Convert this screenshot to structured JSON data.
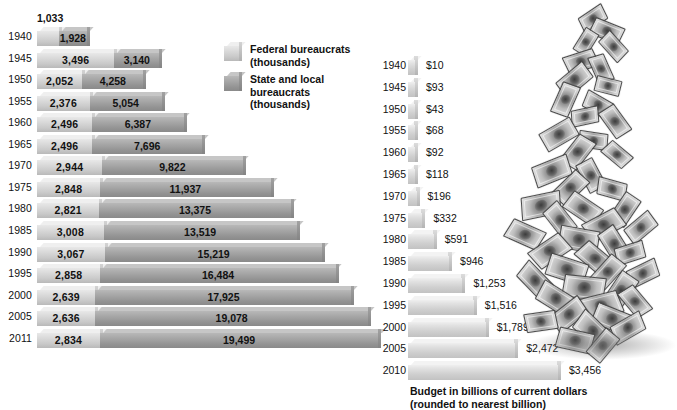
{
  "chart_data": [
    {
      "type": "bar",
      "id": "bureaucrats",
      "title": "",
      "orientation": "horizontal",
      "stacked": true,
      "xlabel": "",
      "ylabel": "",
      "categories": [
        "1940",
        "1945",
        "1950",
        "1955",
        "1960",
        "1965",
        "1970",
        "1975",
        "1980",
        "1985",
        "1990",
        "1995",
        "2000",
        "2005",
        "2011"
      ],
      "series": [
        {
          "name": "Federal bureaucrats (thousands)",
          "values": [
            1033,
            3496,
            2052,
            2376,
            2496,
            2496,
            2944,
            2848,
            2821,
            3008,
            3067,
            2858,
            2639,
            2636,
            2834
          ],
          "labels": [
            "1,033",
            "3,496",
            "2,052",
            "2,376",
            "2,496",
            "2,496",
            "2,944",
            "2,848",
            "2,821",
            "3,008",
            "3,067",
            "2,858",
            "2,639",
            "2,636",
            "2,834"
          ]
        },
        {
          "name": "State and local bureaucrats (thousands)",
          "values": [
            1928,
            3140,
            4258,
            5054,
            6387,
            7696,
            9822,
            11937,
            13375,
            13519,
            15219,
            16484,
            17925,
            19078,
            19499
          ],
          "labels": [
            "1,928",
            "3,140",
            "4,258",
            "5,054",
            "6,387",
            "7,696",
            "9,822",
            "11,937",
            "13,375",
            "13,519",
            "15,219",
            "16,484",
            "17,925",
            "19,078",
            "19,499"
          ]
        }
      ],
      "legend": [
        {
          "label_line1": "Federal bureaucrats",
          "label_line2": "(thousands)",
          "color": "#d8d8d8"
        },
        {
          "label_line1": "State and local bureaucrats",
          "label_line2": "(thousands)",
          "color": "#9b9b9b"
        }
      ],
      "legend_position": "center",
      "grid": false
    },
    {
      "type": "bar",
      "id": "budget",
      "title": "",
      "orientation": "horizontal",
      "stacked": false,
      "categories": [
        "1940",
        "1945",
        "1950",
        "1955",
        "1960",
        "1965",
        "1970",
        "1975",
        "1980",
        "1985",
        "1990",
        "1995",
        "2000",
        "2005",
        "2010"
      ],
      "values": [
        10,
        93,
        43,
        68,
        92,
        118,
        196,
        332,
        591,
        946,
        1253,
        1516,
        1789,
        2472,
        3456
      ],
      "labels": [
        "$10",
        "$93",
        "$43",
        "$68",
        "$92",
        "$118",
        "$196",
        "$332",
        "$591",
        "$946",
        "$1,253",
        "$1,516",
        "$1,789",
        "$2,472",
        "$3,456"
      ],
      "caption_line1": "Budget in billions of current dollars",
      "caption_line2": "(rounded to nearest billion)",
      "xlabel": "",
      "ylabel": "",
      "grid": false,
      "color": "#d7d7d7"
    }
  ],
  "left_chart": {
    "rows": [
      {
        "year": "1940",
        "fed": "1,033",
        "state": "1,928"
      },
      {
        "year": "1945",
        "fed": "3,496",
        "state": "3,140"
      },
      {
        "year": "1950",
        "fed": "2,052",
        "state": "4,258"
      },
      {
        "year": "1955",
        "fed": "2,376",
        "state": "5,054"
      },
      {
        "year": "1960",
        "fed": "2,496",
        "state": "6,387"
      },
      {
        "year": "1965",
        "fed": "2,496",
        "state": "7,696"
      },
      {
        "year": "1970",
        "fed": "2,944",
        "state": "9,822"
      },
      {
        "year": "1975",
        "fed": "2,848",
        "state": "11,937"
      },
      {
        "year": "1980",
        "fed": "2,821",
        "state": "13,375"
      },
      {
        "year": "1985",
        "fed": "3,008",
        "state": "13,519"
      },
      {
        "year": "1990",
        "fed": "3,067",
        "state": "15,219"
      },
      {
        "year": "1995",
        "fed": "2,858",
        "state": "16,484"
      },
      {
        "year": "2000",
        "fed": "2,639",
        "state": "17,925"
      },
      {
        "year": "2005",
        "fed": "2,636",
        "state": "19,078"
      },
      {
        "year": "2011",
        "fed": "2,834",
        "state": "19,499"
      }
    ]
  },
  "legend": {
    "federal_line1": "Federal bureaucrats",
    "federal_line2": "(thousands)",
    "state_line1": "State and local bureaucrats",
    "state_line2": "(thousands)"
  },
  "right_chart": {
    "rows": [
      {
        "year": "1940",
        "amount": "$10"
      },
      {
        "year": "1945",
        "amount": "$93"
      },
      {
        "year": "1950",
        "amount": "$43"
      },
      {
        "year": "1955",
        "amount": "$68"
      },
      {
        "year": "1960",
        "amount": "$92"
      },
      {
        "year": "1965",
        "amount": "$118"
      },
      {
        "year": "1970",
        "amount": "$196"
      },
      {
        "year": "1975",
        "amount": "$332"
      },
      {
        "year": "1980",
        "amount": "$591"
      },
      {
        "year": "1985",
        "amount": "$946"
      },
      {
        "year": "1990",
        "amount": "$1,253"
      },
      {
        "year": "1995",
        "amount": "$1,516"
      },
      {
        "year": "2000",
        "amount": "$1,789"
      },
      {
        "year": "2005",
        "amount": "$2,472"
      },
      {
        "year": "2010",
        "amount": "$3,456"
      }
    ],
    "caption_line1": "Budget in billions of current dollars",
    "caption_line2": "(rounded to nearest billion)"
  }
}
